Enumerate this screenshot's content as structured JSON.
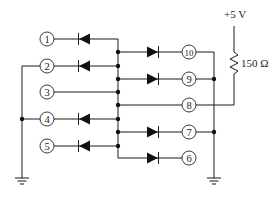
{
  "diagram": {
    "type": "diode-matrix-circuit",
    "supply": {
      "label": "+5 V"
    },
    "resistor": {
      "label": "150 Ω"
    },
    "nodes_left": [
      {
        "id": "n1",
        "label": "1"
      },
      {
        "id": "n2",
        "label": "2"
      },
      {
        "id": "n3",
        "label": "3"
      },
      {
        "id": "n4",
        "label": "4"
      },
      {
        "id": "n5",
        "label": "5"
      }
    ],
    "nodes_right": [
      {
        "id": "n10",
        "label": "10"
      },
      {
        "id": "n9",
        "label": "9"
      },
      {
        "id": "n8",
        "label": "8"
      },
      {
        "id": "n7",
        "label": "7"
      },
      {
        "id": "n6",
        "label": "6"
      }
    ],
    "connections": [
      "1 -> diode (cathode toward 1) -> center bus",
      "2 -> diode (cathode toward 2) -> center bus; 2 tied to left ground bus",
      "3 -> center bus (wire)",
      "4 -> diode (cathode toward 4) -> center bus; 4 tied to left ground bus",
      "5 -> diode (cathode toward 5) -> center bus",
      "center bus -> diode (anode at bus) -> 10",
      "center bus -> diode (anode at bus) -> 9",
      "center bus -> 8 (wire) -> 150 Ω -> +5 V",
      "center bus -> diode (anode at bus) -> 7",
      "center bus -> diode (anode at bus) -> 6",
      "10, 9, 7 tied to right ground bus"
    ],
    "grounds": [
      "left ground",
      "right ground"
    ]
  }
}
